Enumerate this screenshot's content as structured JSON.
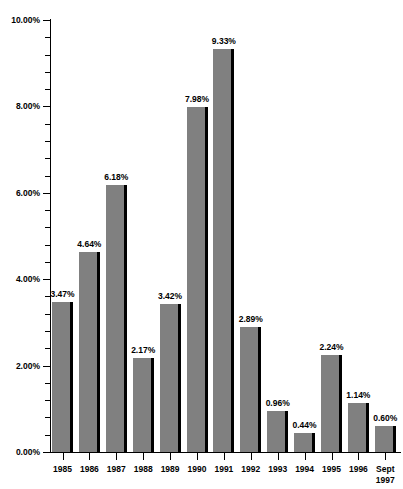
{
  "chart_data": {
    "type": "bar",
    "title": "",
    "xlabel": "",
    "ylabel": "",
    "ylim": [
      0,
      10
    ],
    "y_tick_format": "percent",
    "y_major_ticks": [
      "0.00%",
      "2.00%",
      "4.00%",
      "6.00%",
      "8.00%",
      "10.00%"
    ],
    "y_major_values": [
      0,
      2,
      4,
      6,
      8,
      10
    ],
    "y_minor_step": 0.4,
    "grid": false,
    "legend": "none",
    "bar_color": "#808080",
    "bar_shadow_color": "#000000",
    "categories": [
      "1985",
      "1986",
      "1987",
      "1988",
      "1989",
      "1990",
      "1991",
      "1992",
      "1993",
      "1994",
      "1995",
      "1996",
      "Sept\n1997"
    ],
    "values": [
      3.47,
      4.64,
      6.18,
      2.17,
      3.42,
      7.98,
      9.33,
      2.89,
      0.96,
      0.44,
      2.24,
      1.14,
      0.6
    ],
    "data_labels": [
      "3.47%",
      "4.64%",
      "6.18%",
      "2.17%",
      "3.42%",
      "7.98%",
      "9.33%",
      "2.89%",
      "0.96%",
      "0.44%",
      "2.24%",
      "1.14%",
      "0.60%"
    ]
  }
}
